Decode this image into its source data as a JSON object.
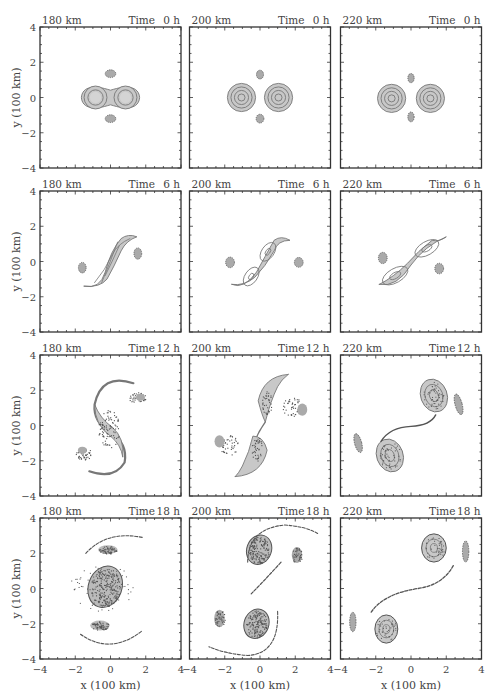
{
  "figure": {
    "xlabel": "x (100 km)",
    "ylabel": "y (100 km)",
    "xticks": [
      "−4",
      "−2",
      "0",
      "2",
      "4"
    ],
    "yticks": [
      "4",
      "2",
      "0",
      "−2",
      "−4"
    ],
    "time_label": "Time"
  },
  "chart_data": {
    "type": "contour-panel-grid",
    "rows": 4,
    "cols": 3,
    "xlabel": "x (100 km)",
    "ylabel": "y (100 km)",
    "xlim": [
      -4,
      4
    ],
    "ylim": [
      -4,
      4
    ],
    "separations_km": [
      180,
      200,
      220
    ],
    "times_h": [
      0,
      6,
      12,
      18
    ],
    "panels": [
      {
        "row": 0,
        "col": 0,
        "separation": "180 km",
        "time": "0 h",
        "description": "Two merged vortices forming a peanut shape centered at origin, two small satellite patches at (0,1.3) and (0,-1.2)"
      },
      {
        "row": 0,
        "col": 1,
        "separation": "200 km",
        "time": "0 h",
        "description": "Two separate circular vortices at x=-1 and x=1, satellite patches above and below"
      },
      {
        "row": 0,
        "col": 2,
        "separation": "220 km",
        "time": "0 h",
        "description": "Two separate circular vortices at x=-1.1 and x=1.1, satellite patches above and below"
      },
      {
        "row": 1,
        "col": 0,
        "separation": "180 km",
        "time": "6 h",
        "description": "Vortices merging into elongated S-shape oriented steeply, satellites at (-1.6,-0.2) and (1.6,0.5)"
      },
      {
        "row": 1,
        "col": 1,
        "separation": "200 km",
        "time": "6 h",
        "description": "Elongated S-shaped pair, two cores visible, satellites on left and right"
      },
      {
        "row": 1,
        "col": 2,
        "separation": "220 km",
        "time": "6 h",
        "description": "Elongated pair tilted ~30 deg, two distinct cores, satellites at left and right"
      },
      {
        "row": 2,
        "col": 0,
        "separation": "180 km",
        "time": "12 h",
        "description": "Single merged S-shaped vortex with spiral arms and filaments"
      },
      {
        "row": 2,
        "col": 1,
        "separation": "200 km",
        "time": "12 h",
        "description": "Two cores connected by thin filament in S pattern, satellite fragments"
      },
      {
        "row": 2,
        "col": 2,
        "separation": "220 km",
        "time": "12 h",
        "description": "Two separate cores at (1.2,1.6) and (-1.2,-1.6) connected by thin filament"
      },
      {
        "row": 3,
        "col": 0,
        "separation": "180 km",
        "time": "18 h",
        "description": "Single merged central vortex near (-0.3,0.2) with two satellites above and below"
      },
      {
        "row": 3,
        "col": 1,
        "separation": "200 km",
        "time": "18 h",
        "description": "Two cores at (0,2.5) and (-0.3,-2.1), arcs and fragments"
      },
      {
        "row": 3,
        "col": 2,
        "separation": "220 km",
        "time": "18 h",
        "description": "Two cores at (1.1,2.6) and (-1.5,-2.1), long dashed filament, edge fragments"
      }
    ]
  },
  "panels": [
    {
      "sep": "180 km",
      "time": "0 h"
    },
    {
      "sep": "200 km",
      "time": "0 h"
    },
    {
      "sep": "220 km",
      "time": "0 h"
    },
    {
      "sep": "180 km",
      "time": "6 h"
    },
    {
      "sep": "200 km",
      "time": "6 h"
    },
    {
      "sep": "220 km",
      "time": "6 h"
    },
    {
      "sep": "180 km",
      "time": "12 h"
    },
    {
      "sep": "200 km",
      "time": "12 h"
    },
    {
      "sep": "220 km",
      "time": "12 h"
    },
    {
      "sep": "180 km",
      "time": "18 h"
    },
    {
      "sep": "200 km",
      "time": "18 h"
    },
    {
      "sep": "220 km",
      "time": "18 h"
    }
  ],
  "colors": {
    "frame": "#333333",
    "fill": "#c8c8c8",
    "contour": "#777777",
    "dark": "#555555"
  }
}
